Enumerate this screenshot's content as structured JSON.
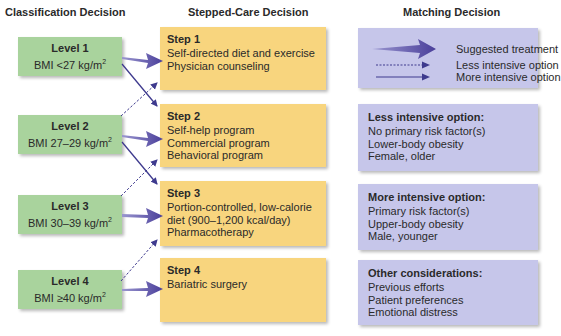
{
  "columns": {
    "classification": "Classification Decision",
    "stepped_care": "Stepped-Care Decision",
    "matching": "Matching Decision"
  },
  "levels": [
    {
      "title": "Level 1",
      "bmi_prefix": "BMI <27 kg/m",
      "sup": "2"
    },
    {
      "title": "Level 2",
      "bmi_prefix": "BMI 27–29 kg/m",
      "sup": "2"
    },
    {
      "title": "Level 3",
      "bmi_prefix": "BMI 30–39 kg/m",
      "sup": "2"
    },
    {
      "title": "Level 4",
      "bmi_prefix": "BMI ≥40 kg/m",
      "sup": "2"
    }
  ],
  "steps": [
    {
      "title": "Step 1",
      "lines": [
        "Self-directed diet and exercise",
        "Physician counseling"
      ]
    },
    {
      "title": "Step 2",
      "lines": [
        "Self-help program",
        "Commercial program",
        "Behavioral program"
      ]
    },
    {
      "title": "Step 3",
      "lines": [
        "Portion-controlled, low-calorie",
        "diet (900–1,200 kcal/day)",
        "Pharmacotherapy"
      ]
    },
    {
      "title": "Step 4",
      "lines": [
        "Bariatric surgery"
      ]
    }
  ],
  "legend": {
    "suggested": "Suggested treatment",
    "less": "Less intensive option",
    "more": "More intensive option"
  },
  "matching": [
    {
      "title": "Less intensive option:",
      "lines": [
        "No primary risk factor(s)",
        "Lower-body obesity",
        "Female, older"
      ]
    },
    {
      "title": "More intensive option:",
      "lines": [
        "Primary risk factor(s)",
        "Upper-body obesity",
        "Male, younger"
      ]
    },
    {
      "title": "Other considerations:",
      "lines": [
        "Previous efforts",
        "Patient preferences",
        "Emotional distress"
      ]
    }
  ],
  "colors": {
    "level_box": "#a9d39d",
    "step_box": "#f8d57e",
    "matching_box": "#c6c6ea",
    "arrow": "#3e3a8e"
  }
}
